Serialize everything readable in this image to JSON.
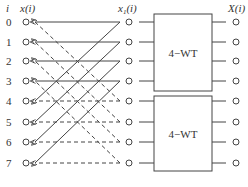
{
  "headers": {
    "index": "i",
    "input": "x(i)",
    "intermediate": "x1(i)",
    "output": "X(i)"
  },
  "rows": [
    "0",
    "1",
    "2",
    "3",
    "4",
    "5",
    "6",
    "7"
  ],
  "blocks": [
    {
      "label": "4−WT",
      "rows": [
        0,
        1,
        2,
        3
      ]
    },
    {
      "label": "4−WT",
      "rows": [
        4,
        5,
        6,
        7
      ]
    }
  ],
  "edges": {
    "solid_horizontal": [
      [
        0,
        0
      ],
      [
        1,
        1
      ],
      [
        2,
        2
      ],
      [
        3,
        3
      ]
    ],
    "solid_diagonal": [
      [
        4,
        0
      ],
      [
        5,
        1
      ],
      [
        6,
        2
      ],
      [
        7,
        3
      ]
    ],
    "dashed_diagonal": [
      [
        0,
        4
      ],
      [
        1,
        5
      ],
      [
        2,
        6
      ],
      [
        3,
        7
      ]
    ],
    "dashed_horizontal": [
      [
        4,
        4
      ],
      [
        5,
        5
      ],
      [
        6,
        6
      ],
      [
        7,
        7
      ]
    ]
  },
  "colors": {
    "line": "#444444",
    "text": "#333333",
    "background": "#ffffff"
  }
}
